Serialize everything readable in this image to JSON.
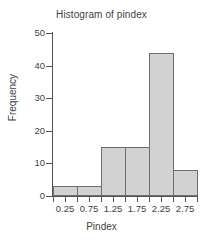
{
  "chart_data": {
    "type": "bar",
    "title": "Histogram of pindex",
    "xlabel": "Pindex",
    "ylabel": "Frequency",
    "categories": [
      "0.25",
      "0.75",
      "1.25",
      "1.75",
      "2.25",
      "2.75"
    ],
    "values": [
      3,
      3,
      15,
      15,
      44,
      8
    ],
    "bin_edges": [
      0.0,
      0.5,
      1.0,
      1.5,
      2.0,
      2.5,
      3.0
    ],
    "bin_width": 0.5,
    "xtick_labels": [
      "0.25",
      "0.75",
      "1.25",
      "1.75",
      "2.25",
      "2.75"
    ],
    "xlim": [
      0.0,
      3.0
    ],
    "ylim": [
      0,
      50
    ],
    "ytick_labels": [
      "0",
      "10",
      "20",
      "30",
      "40",
      "50"
    ],
    "ytick_values": [
      0,
      10,
      20,
      30,
      40,
      50
    ],
    "grid": false,
    "legend": false,
    "legend_position": "none",
    "bar_fill_color": "#d2d2d2",
    "bar_edge_color": "#6e6e6e",
    "axis_color": "#555555",
    "text_color": "#3f3f3f",
    "background_color": "#ffffff"
  }
}
